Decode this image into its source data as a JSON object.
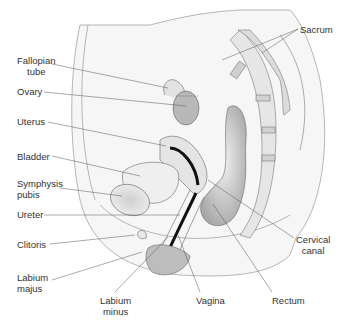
{
  "diagram": {
    "labels": {
      "fallopian_tube": "Fallopian tube",
      "fallopian_tube_l1": "Fallopian",
      "fallopian_tube_l2": "tube",
      "ovary": "Ovary",
      "uterus": "Uterus",
      "bladder": "Bladder",
      "symphysis_l1": "Symphysis",
      "symphysis_l2": "pubis",
      "ureter": "Ureter",
      "clitoris": "Clitoris",
      "labium_majus_l1": "Labium",
      "labium_majus_l2": "majus",
      "labium_minus_l1": "Labium",
      "labium_minus_l2": "minus",
      "vagina": "Vagina",
      "rectum": "Rectum",
      "cervical_canal_l1": "Cervical",
      "cervical_canal_l2": "canal",
      "sacrum": "Sacrum"
    },
    "colors": {
      "line": "#555555",
      "tissue_light": "#eeeeee",
      "tissue_mid": "#c8c8c8",
      "tissue_dark": "#999999",
      "canal": "#111111"
    }
  }
}
